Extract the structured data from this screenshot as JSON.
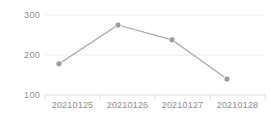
{
  "chart_data": {
    "type": "line",
    "title": "",
    "xlabel": "",
    "ylabel": "",
    "categories": [
      "20210125",
      "20210126",
      "20210127",
      "20210128"
    ],
    "values": [
      178,
      275,
      238,
      140
    ],
    "series": [
      {
        "name": "",
        "values": [
          178,
          275,
          238,
          140
        ]
      }
    ],
    "ylim": [
      100,
      300
    ],
    "yticks": [
      100,
      200,
      300
    ],
    "ytick_labels": [
      "100",
      "200",
      "300"
    ],
    "grid": true,
    "legend": false,
    "legend_position": "none",
    "marker": "circle",
    "colors": {
      "line": "#a6a6a6",
      "marker": "#9e9e9e",
      "grid": "#eeeeee",
      "axis": "#e0e0e0",
      "tick_text": "#8e8e8e",
      "background": "#ffffff"
    }
  }
}
